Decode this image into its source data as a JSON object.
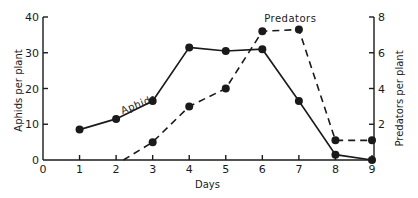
{
  "chart_data": {
    "type": "line",
    "title": "",
    "xlabel": "Days",
    "ylabel": "Aphids per plant",
    "y2label": "Predators per plant",
    "xlim": [
      0,
      9
    ],
    "ylim": [
      0,
      40
    ],
    "y2lim": [
      0,
      8
    ],
    "x_ticks": [
      "0",
      "1",
      "2",
      "3",
      "4",
      "5",
      "6",
      "7",
      "8",
      "9"
    ],
    "y_ticks": [
      "0",
      "10",
      "20",
      "30",
      "40"
    ],
    "y2_ticks": [
      "2",
      "4",
      "6",
      "8"
    ],
    "grid": false,
    "legend": "none",
    "series": [
      {
        "name": "Aphids",
        "axis": "left",
        "style": "solid",
        "x": [
          1,
          2,
          3,
          4,
          5,
          6,
          7,
          8,
          9
        ],
        "values": [
          8.5,
          11.5,
          16.5,
          31.5,
          30.5,
          31,
          16.5,
          1.5,
          0
        ]
      },
      {
        "name": "Predators",
        "axis": "right",
        "style": "dashed",
        "x": [
          2.2,
          3,
          4,
          5,
          6,
          7,
          8,
          9
        ],
        "values": [
          0,
          1,
          3,
          4,
          7.2,
          7.3,
          1.1,
          1.1
        ],
        "markers_from_index": 1
      }
    ],
    "annotations": [
      {
        "text": "Aphids",
        "series": "Aphids"
      },
      {
        "text": "Predators",
        "series": "Predators"
      }
    ]
  }
}
